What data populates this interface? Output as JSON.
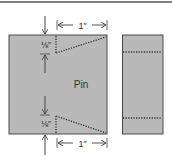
{
  "diagram": {
    "main_label": "Pin",
    "top_dim": "1″",
    "bottom_dim": "1″",
    "top_offset": "⅛″",
    "bottom_offset": "⅛″"
  },
  "colors": {
    "fill": "#b9b9b9",
    "stroke": "#4a4a4a",
    "dots": "#3a3a3a",
    "arrow": "#444444"
  }
}
